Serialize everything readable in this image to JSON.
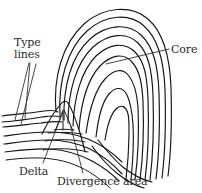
{
  "figure": {
    "type": "line-drawing",
    "background_color": "#ffffff",
    "ink_color": "#151515",
    "text_color": "#2a2a2a",
    "width": 202,
    "height": 193
  },
  "labels": {
    "type_lines": {
      "line1": "Type",
      "line2": "lines"
    },
    "core": "Core",
    "delta": "Delta",
    "divergence_area": "Divergence area"
  },
  "annotations": [
    {
      "name": "type-lines",
      "text": "Type lines",
      "text_x": 14,
      "text_y": 37,
      "leader_from": [
        30,
        62
      ],
      "leader_to": [
        12,
        118
      ],
      "leader_style": "double-line-wedge"
    },
    {
      "name": "core",
      "text": "Core",
      "text_x": 171,
      "text_y": 44,
      "leader_from": [
        168,
        49
      ],
      "leader_to": [
        105,
        64
      ],
      "leader_style": "single-line"
    },
    {
      "name": "delta",
      "text": "Delta",
      "text_x": 19,
      "text_y": 166,
      "leader_from": [
        42,
        164
      ],
      "leader_to": [
        63,
        110
      ],
      "leader_style": "single-line"
    },
    {
      "name": "divergence-area",
      "text": "Divergence area",
      "text_x": 57,
      "text_y": 176,
      "leader_from": [
        82,
        173
      ],
      "leader_to": [
        70,
        122
      ],
      "leader_style": "single-line"
    }
  ],
  "features": {
    "pattern": "loop",
    "core_position": [
      105,
      64
    ],
    "delta_position": [
      63,
      110
    ],
    "ridge_count": 9
  }
}
